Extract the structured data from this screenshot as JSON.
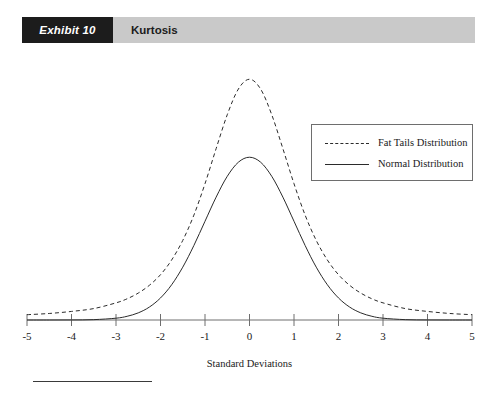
{
  "exhibit": {
    "tag": "Exhibit 10",
    "title": "Kurtosis"
  },
  "legend": {
    "position": "inside-top-right",
    "items": [
      {
        "label": "Fat Tails Distribution",
        "style": "dashed"
      },
      {
        "label": "Normal Distribution",
        "style": "solid"
      }
    ]
  },
  "axis": {
    "xlabel": "Standard Deviations",
    "ticks": [
      "-5",
      "-4",
      "-3",
      "-2",
      "-1",
      "0",
      "1",
      "2",
      "3",
      "4",
      "5"
    ]
  },
  "colors": {
    "tag_background": "#1c1c1c",
    "header_band": "#c9c9c9",
    "curve": "#2b2b2b",
    "axis": "#6e6e6e",
    "text": "#1a1a1a"
  },
  "chart_data": {
    "type": "line",
    "title": "Kurtosis",
    "xlabel": "Standard Deviations",
    "ylabel": "",
    "xlim": [
      -5,
      5
    ],
    "ylim": [
      0,
      0.62
    ],
    "grid": false,
    "legend_position": "inside-top-right",
    "xticks": [
      -5,
      -4,
      -3,
      -2,
      -1,
      0,
      1,
      2,
      3,
      4,
      5
    ],
    "x": [
      -5,
      -4.5,
      -4,
      -3.5,
      -3,
      -2.75,
      -2.5,
      -2.25,
      -2,
      -1.75,
      -1.5,
      -1.25,
      -1,
      -0.75,
      -0.5,
      -0.25,
      0,
      0.25,
      0.5,
      0.75,
      1,
      1.25,
      1.5,
      1.75,
      2,
      2.25,
      2.5,
      2.75,
      3,
      3.5,
      4,
      4.5,
      5
    ],
    "series": [
      {
        "name": "Fat Tails Distribution",
        "style": "dashed",
        "description": "Leptokurtic: higher, narrower peak and fatter tails than the normal curve",
        "values": [
          0.013,
          0.016,
          0.021,
          0.028,
          0.042,
          0.052,
          0.066,
          0.085,
          0.111,
          0.147,
          0.195,
          0.257,
          0.334,
          0.42,
          0.503,
          0.566,
          0.59,
          0.566,
          0.503,
          0.42,
          0.334,
          0.257,
          0.195,
          0.147,
          0.111,
          0.085,
          0.066,
          0.052,
          0.042,
          0.028,
          0.021,
          0.016,
          0.013
        ]
      },
      {
        "name": "Normal Distribution",
        "style": "solid",
        "description": "Mesokurtic reference normal curve, standard deviation 1",
        "values": [
          1.5e-06,
          1.6e-05,
          0.00013,
          0.0009,
          0.0044,
          0.0091,
          0.0175,
          0.0317,
          0.054,
          0.0863,
          0.1295,
          0.1826,
          0.242,
          0.3011,
          0.3521,
          0.3867,
          0.3989,
          0.3867,
          0.3521,
          0.3011,
          0.242,
          0.1826,
          0.1295,
          0.0863,
          0.054,
          0.0317,
          0.0175,
          0.0091,
          0.0044,
          0.0009,
          0.00013,
          1.6e-05,
          1.5e-06
        ]
      }
    ],
    "annotations": [
      "Curves intersect near -2.3 and +2.3 standard deviations",
      "Fat tails curve peaks above the normal curve at 0"
    ]
  }
}
